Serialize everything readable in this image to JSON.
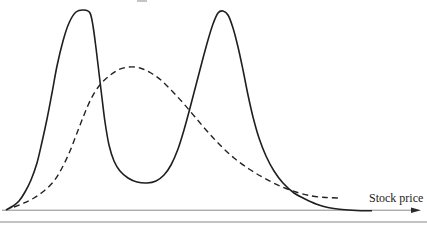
{
  "window": {
    "width": 427,
    "height": 227,
    "background": "#ffffff"
  },
  "chart_data": {
    "type": "line",
    "title": "",
    "subtitle": "",
    "xlabel": "Stock price",
    "ylabel": "",
    "legend": "none",
    "grid": false,
    "units": "px",
    "axes": {
      "x_ticks": [],
      "y_ticks": [],
      "numeric_scale_shown": false,
      "x_axis": {
        "x1": 2,
        "x2": 411,
        "y": 210.2,
        "tip_x": 421,
        "line_color": "#8a8a8a",
        "line_width": 1,
        "arrow_color": "#2b2b2b",
        "arrow_half_width": 2.8
      }
    },
    "series": [
      {
        "name": "solid-bimodal-curve",
        "description": "solid curve with two peaks",
        "style": "solid",
        "color": "#1f1f1f",
        "width": 1.6,
        "dash": "",
        "points": [
          [
            6,
            210
          ],
          [
            13,
            206
          ],
          [
            19,
            201
          ],
          [
            25,
            192
          ],
          [
            31,
            180
          ],
          [
            37,
            163
          ],
          [
            42,
            142
          ],
          [
            47,
            119
          ],
          [
            52,
            93
          ],
          [
            57,
            66
          ],
          [
            63,
            41
          ],
          [
            69,
            23
          ],
          [
            76,
            12
          ],
          [
            84,
            10
          ],
          [
            90,
            13
          ],
          [
            93,
            26
          ],
          [
            96,
            48
          ],
          [
            99,
            73
          ],
          [
            102,
            98
          ],
          [
            105,
            122
          ],
          [
            109,
            145
          ],
          [
            114,
            161
          ],
          [
            120,
            171
          ],
          [
            128,
            178
          ],
          [
            137,
            182
          ],
          [
            147,
            183
          ],
          [
            156,
            181
          ],
          [
            164,
            175
          ],
          [
            171,
            165
          ],
          [
            178,
            149
          ],
          [
            184,
            130
          ],
          [
            190,
            108
          ],
          [
            196,
            85
          ],
          [
            202,
            62
          ],
          [
            208,
            40
          ],
          [
            213,
            24
          ],
          [
            218,
            13
          ],
          [
            223,
            11
          ],
          [
            228,
            15
          ],
          [
            233,
            28
          ],
          [
            238,
            47
          ],
          [
            243,
            70
          ],
          [
            248,
            95
          ],
          [
            253,
            117
          ],
          [
            259,
            138
          ],
          [
            266,
            156
          ],
          [
            274,
            171
          ],
          [
            283,
            183
          ],
          [
            294,
            193
          ],
          [
            305,
            199
          ],
          [
            316,
            204
          ],
          [
            328,
            207.5
          ],
          [
            342,
            209.5
          ],
          [
            356,
            210.5
          ],
          [
            372,
            210.8
          ]
        ]
      },
      {
        "name": "dashed-unimodal-curve",
        "description": "dashed curve with single broad peak",
        "style": "dashed",
        "color": "#222222",
        "width": 1.4,
        "dash": "6 4",
        "points": [
          [
            14,
            207
          ],
          [
            24,
            203
          ],
          [
            34,
            198
          ],
          [
            44,
            191
          ],
          [
            54,
            181
          ],
          [
            62,
            168
          ],
          [
            70,
            151
          ],
          [
            77,
            133
          ],
          [
            84,
            115
          ],
          [
            91,
            99
          ],
          [
            99,
            86
          ],
          [
            108,
            77
          ],
          [
            118,
            70
          ],
          [
            129,
            67
          ],
          [
            140,
            68
          ],
          [
            151,
            73
          ],
          [
            162,
            81
          ],
          [
            173,
            92
          ],
          [
            184,
            104
          ],
          [
            195,
            117
          ],
          [
            207,
            131
          ],
          [
            220,
            145
          ],
          [
            234,
            158
          ],
          [
            249,
            169
          ],
          [
            264,
            178
          ],
          [
            280,
            186
          ],
          [
            296,
            192
          ],
          [
            312,
            196
          ],
          [
            326,
            197.5
          ],
          [
            338,
            198
          ]
        ]
      }
    ],
    "decorations": {
      "bottom_rule_color": "#c2c2c2",
      "cropped_text_artifact_color": "#ababab"
    }
  }
}
